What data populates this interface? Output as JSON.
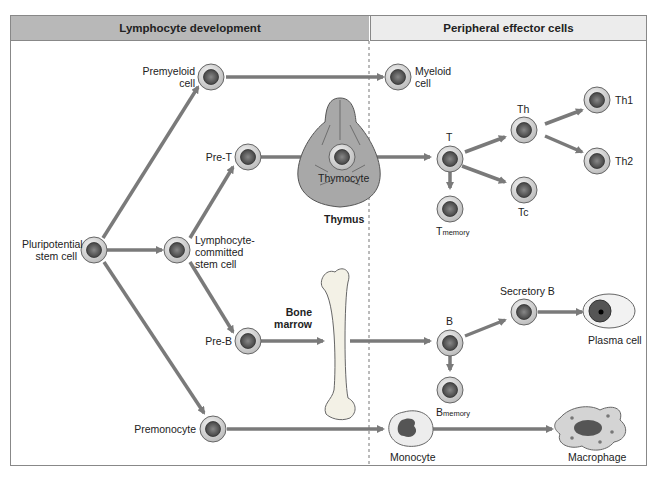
{
  "header": {
    "left_title": "Lymphocyte development",
    "right_title": "Peripheral effector cells"
  },
  "colors": {
    "arrow": "#7a7a7a",
    "header_left_bg": "#b8b8b8",
    "header_right_bg": "#ececec",
    "cell_ring": "#d9d9d9",
    "cell_nucleus": "#555555"
  },
  "cells": {
    "pluripotential": {
      "line1": "Pluripotential",
      "line2": "stem cell"
    },
    "premyeloid": {
      "line1": "Premyeloid",
      "line2": "cell"
    },
    "myeloid": {
      "line1": "Myeloid",
      "line2": "cell"
    },
    "pre_t": "Pre-T",
    "thymocyte": "Thymocyte",
    "lymphocyte_committed": {
      "line1": "Lymphocyte-",
      "line2": "committed",
      "line3": "stem cell"
    },
    "pre_b": "Pre-B",
    "premonocyte": "Premonocyte",
    "t": "T",
    "t_memory": {
      "main": "T",
      "sub": "memory"
    },
    "th": "Th",
    "th1": "Th1",
    "th2": "Th2",
    "tc": "Tc",
    "b": "B",
    "b_memory": {
      "main": "B",
      "sub": "memory"
    },
    "secretory_b": "Secretory B",
    "plasma": "Plasma cell",
    "monocyte": "Monocyte",
    "macrophage": "Macrophage"
  },
  "organs": {
    "thymus": "Thymus",
    "bone_marrow": {
      "line1": "Bone",
      "line2": "marrow"
    }
  }
}
